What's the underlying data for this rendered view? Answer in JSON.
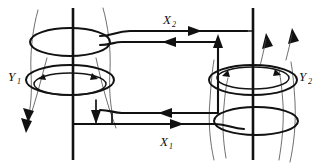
{
  "figure": {
    "background_color": "#ffffff",
    "ink_color": "#111111",
    "fieldline_color": "#4a4a4a",
    "width": 323,
    "height": 167
  },
  "labels": {
    "x2": {
      "base": "X",
      "sub": "2",
      "position": "top-center",
      "x": 163,
      "y": 24
    },
    "x1": {
      "base": "X",
      "sub": "1",
      "position": "bottom-center",
      "x": 160,
      "y": 146
    },
    "y1": {
      "base": "Y",
      "sub": "1",
      "position": "left-middle",
      "x": 8,
      "y": 81
    },
    "y2": {
      "base": "Y",
      "sub": "2",
      "position": "right-middle",
      "x": 299,
      "y": 81
    }
  },
  "left_coil": {
    "name": "left-coil-assembly",
    "axis_x": 73,
    "axis_top_y": 8,
    "axis_bottom_y": 160,
    "upper_ellipse": {
      "cx": 70,
      "cy": 42,
      "rx": 40,
      "ry": 14
    },
    "lower_ellipse_outer": {
      "cx": 70,
      "cy": 80,
      "rx": 44,
      "ry": 15
    },
    "lower_ellipse_inner": {
      "cx": 70,
      "cy": 84,
      "rx": 36,
      "ry": 11
    },
    "circulation": "counterclockwise-viewed-from-above",
    "field_direction": "downward"
  },
  "right_coil": {
    "name": "right-coil-assembly",
    "axis_x": 253,
    "axis_top_y": 8,
    "axis_bottom_y": 160,
    "upper_ellipse_outer": {
      "cx": 253,
      "cy": 80,
      "rx": 44,
      "ry": 15
    },
    "upper_ellipse_inner": {
      "cx": 253,
      "cy": 78,
      "rx": 36,
      "ry": 11
    },
    "lower_ellipse": {
      "cx": 256,
      "cy": 121,
      "rx": 42,
      "ry": 14
    },
    "circulation": "counterclockwise-viewed-from-above",
    "field_direction": "upward"
  },
  "circuit": {
    "name": "rectangular-current-loop",
    "top_wire": {
      "from_x": 110,
      "to_x": 222,
      "y": 43,
      "current_label": "X2",
      "arrow_direction": "right"
    },
    "bottom_wire": {
      "from_x": 108,
      "to_x": 222,
      "y": 121,
      "current_label": "X1",
      "arrow_direction": "right"
    },
    "inner_top": {
      "y": 49,
      "arrow_direction": "left"
    },
    "inner_bottom": {
      "y": 113,
      "arrow_direction": "left"
    },
    "left_side_x": 112,
    "right_side_x": 218
  },
  "arrows": {
    "top_wire_right": "right",
    "bottom_wire_right": "right",
    "inner_top_left": "left",
    "inner_bottom_left": "left",
    "left_field_down": "down",
    "right_field_up": "up"
  }
}
